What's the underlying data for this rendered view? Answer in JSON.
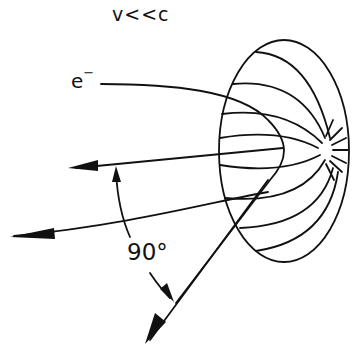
{
  "title": "v<<c",
  "labels": {
    "electron": "e",
    "electron_charge": "−",
    "angle": "90°"
  },
  "elements": {
    "emission_pattern": "dipole radiation lobe (doughnut)",
    "electron_path": "curved trajectory with acceleration",
    "velocity_arrow": "arrow pointing left",
    "emission_arrow": "arrow pointing down-left",
    "far_arrow": "arrow pointing left (lower)"
  },
  "colors": {
    "line": "#111111",
    "background": "#ffffff"
  }
}
